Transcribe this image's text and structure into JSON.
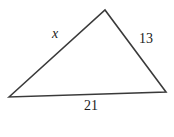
{
  "figure": {
    "name": "scalene-triangle-diagram",
    "background_color": "#ffffff",
    "stroke_color": "#3a3a3a",
    "text_color": "#1b1b1b",
    "width": 174,
    "height": 137,
    "vertices": {
      "left": {
        "x": 9,
        "y": 97
      },
      "apex": {
        "x": 105,
        "y": 10
      },
      "right": {
        "x": 166,
        "y": 92
      }
    },
    "labels": {
      "left_side": "x",
      "right_side": "13",
      "bottom_side": "21"
    }
  }
}
